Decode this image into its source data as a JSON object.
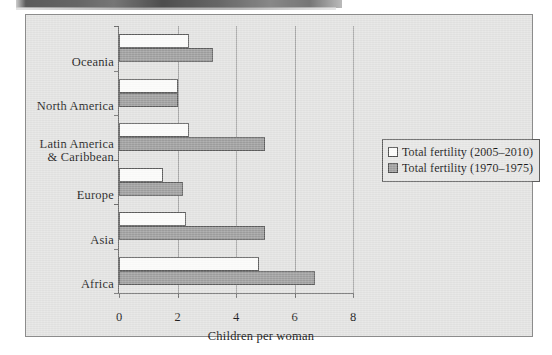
{
  "chart_data": {
    "type": "bar",
    "orientation": "horizontal",
    "title": "",
    "xlabel": "Children per woman",
    "ylabel": "",
    "xlim": [
      0,
      8
    ],
    "xticks": [
      0,
      2,
      4,
      6,
      8
    ],
    "xtick_labels": [
      "0",
      "2",
      "4",
      "6",
      "8"
    ],
    "grid": "vertical",
    "legend_position": "right",
    "categories": [
      "Oceania",
      "North America",
      "Latin America\n& Caribbean",
      "Europe",
      "Asia",
      "Africa"
    ],
    "series": [
      {
        "name": "Total fertility (2005–2010)",
        "color": "#fbfbfa",
        "values": [
          2.4,
          2.0,
          2.4,
          1.5,
          2.3,
          4.8
        ]
      },
      {
        "name": "Total fertility (1970–1975)",
        "color": "#9e9e9e",
        "values": [
          3.2,
          2.0,
          5.0,
          2.2,
          5.0,
          6.7
        ]
      }
    ]
  },
  "legend": {
    "items": [
      {
        "label": "Total fertility (2005–2010)",
        "swatch": "recent"
      },
      {
        "label": "Total fertility (1970–1975)",
        "swatch": "older"
      }
    ]
  },
  "axis": {
    "x_title": "Children per woman",
    "tick_0": "0",
    "tick_2": "2",
    "tick_4": "4",
    "tick_6": "6",
    "tick_8": "8"
  },
  "categories": {
    "oceania": "Oceania",
    "north_america": "North America",
    "latin_america": "Latin America\n& Caribbean",
    "europe": "Europe",
    "asia": "Asia",
    "africa": "Africa"
  },
  "colors": {
    "recent_series": "#fbfbfa",
    "older_series": "#9e9e9e",
    "plot_background": "#e3e3e2",
    "axis": "#6e6e6e",
    "gridline": "#a6a6a6"
  }
}
